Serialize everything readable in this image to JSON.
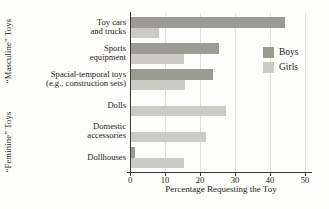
{
  "chart_data": {
    "type": "bar",
    "orientation": "horizontal",
    "title": "",
    "xlabel": "Percentage Requesting the Toy",
    "ylabel": "",
    "xlim": [
      0,
      52
    ],
    "x_ticks": [
      0,
      10,
      20,
      30,
      40,
      50
    ],
    "grid": "vertical",
    "legend_position": "inside-right",
    "categories": [
      "Toy cars and trucks",
      "Sports equipment",
      "Spacial-temporal toys (e.g., construction sets)",
      "Dolls",
      "Domestic accessories",
      "Dollhouses"
    ],
    "category_label_lines": [
      [
        "Toy cars",
        "and trucks"
      ],
      [
        "Sports",
        "equipment"
      ],
      [
        "Spacial-temporal toys",
        "(e.g., construction sets)"
      ],
      [
        "Dolls"
      ],
      [
        "Domestic",
        "accessories"
      ],
      [
        "Dollhouses"
      ]
    ],
    "series": [
      {
        "name": "Boys",
        "color": "#9b9a93",
        "values": [
          44,
          25,
          23.5,
          0,
          0,
          1
        ]
      },
      {
        "name": "Girls",
        "color": "#cbcac4",
        "values": [
          8,
          15,
          15.5,
          27,
          21.5,
          15
        ]
      }
    ],
    "side_labels": [
      "“Masculine” Toys",
      "“Feminine” Toys"
    ],
    "colors": {
      "grid": "#dededa",
      "axis": "#3c3c3c",
      "text": "#1c1c1c",
      "background": "#fcfcfa"
    }
  }
}
